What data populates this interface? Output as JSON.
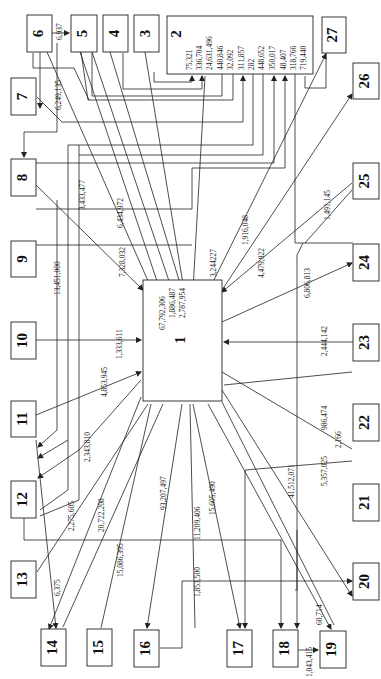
{
  "nodes": {
    "n1": "1",
    "n2": "2",
    "n3": "3",
    "n4": "4",
    "n5": "5",
    "n6": "6",
    "n7": "7",
    "n8": "8",
    "n9": "9",
    "n10": "10",
    "n11": "11",
    "n12": "12",
    "n13": "13",
    "n14": "14",
    "n15": "15",
    "n16": "16",
    "n17": "17",
    "n18": "18",
    "n19": "19",
    "n20": "20",
    "n21": "21",
    "n22": "22",
    "n23": "23",
    "n24": "24",
    "n25": "25",
    "n26": "26",
    "n27": "27"
  },
  "box2_values": [
    "75,321",
    "336,704",
    "24,631,496",
    "440,846",
    "32,092",
    "311,857",
    "282",
    "448,652",
    "350,017",
    "48,407",
    "318,766",
    "719,440"
  ],
  "box1_values": [
    "67,792,306",
    "1,886,487",
    "2,787,954"
  ],
  "flows": {
    "f6_5": "6,937",
    "f7": "6,249,135",
    "f3433": "3,433,477",
    "f6434": "6,434,972",
    "f7328": "7,328,032",
    "f13451": "13,451,000",
    "f1333": "1,333,611",
    "f4853": "4,853,945",
    "f2343": "2,343,810",
    "f2275": "2,275,605",
    "f20722": "20,722,208",
    "f15086": "15,086,395",
    "f93207": "93,207,497",
    "f11209": "11,209,406",
    "f1853": "1,853,500",
    "f15605": "15,605,490",
    "f41512": "41,512,071",
    "f5357": "5,357,025",
    "f2166": "2,166",
    "f986": "986,474",
    "f2444": "2,444,142",
    "f6806": "6,806,813",
    "f4479": "4,479,922",
    "f1491": "1,491,145",
    "f1916": "1,916,048",
    "f3244": "3,244227",
    "f6375": "6,375",
    "f1043": "1,043,415",
    "f60714": "60,714"
  }
}
